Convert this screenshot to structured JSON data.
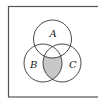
{
  "diagram": {
    "type": "venn",
    "sets": [
      {
        "name": "A",
        "cx": 52.5,
        "cy": 39,
        "r": 19
      },
      {
        "name": "B",
        "cx": 43,
        "cy": 63,
        "r": 19
      },
      {
        "name": "C",
        "cx": 62,
        "cy": 63,
        "r": 19
      }
    ],
    "shaded_region": "B ∩ C ∩ A'",
    "colors": {
      "stroke": "#333333",
      "shade": "#c8c8c8",
      "frame": "#555555",
      "background": "#ffffff"
    }
  }
}
